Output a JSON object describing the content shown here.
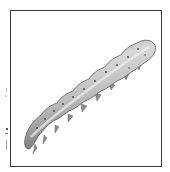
{
  "figure": {
    "subject": "caterpillar",
    "description": "Grayscale illustration of a caterpillar larva, lying diagonally, inside a square frame",
    "colors": {
      "frame_border": "#3a3a3a",
      "background": "#ffffff",
      "body_light": "#d6d6d6",
      "body_mid": "#9a9a9a",
      "body_dark": "#5a5a5a",
      "spots": "#444444"
    }
  }
}
